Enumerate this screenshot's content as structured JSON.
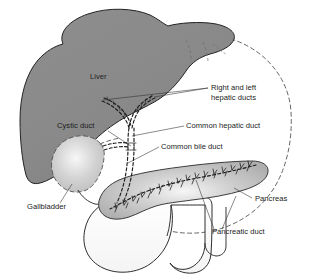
{
  "figure": {
    "background_color": "#ffffff",
    "width": 313,
    "height": 276
  },
  "colors": {
    "liver_fill": "#8a8a8a",
    "liver_stroke": "#232323",
    "pancreas_fill": "#b4b4b4",
    "pancreas_highlight": "#f2f2f2",
    "gallbladder_fill": "#c9c9c9",
    "gallbladder_highlight": "#f4f4f4",
    "duodenum_fill": "#ffffff",
    "duct_stroke": "#1c1c1c",
    "dashed_outline": "#4a4a4a",
    "label_text": "#1b1b1b",
    "leader_line": "#2b2b2b"
  },
  "labels": [
    {
      "id": "liver",
      "text": "Liver",
      "x": 90,
      "y": 79,
      "anchor": "start",
      "has_leader": false,
      "kind": "organ-inline"
    },
    {
      "id": "right-and-left-hepatic-ducts",
      "text": "Right and left",
      "text_line2": "hepatic ducts",
      "x": 211,
      "y": 90,
      "anchor": "start",
      "has_leader": true,
      "kind": "duct"
    },
    {
      "id": "cystic-duct",
      "text": "Cystic duct",
      "x": 57,
      "y": 128,
      "anchor": "start",
      "has_leader": true,
      "kind": "duct"
    },
    {
      "id": "common-hepatic-duct",
      "text": "Common hepatic duct",
      "x": 186,
      "y": 128,
      "anchor": "start",
      "has_leader": true,
      "kind": "duct"
    },
    {
      "id": "common-bile-duct",
      "text": "Common bile duct",
      "x": 161,
      "y": 149,
      "anchor": "start",
      "has_leader": true,
      "kind": "duct"
    },
    {
      "id": "gallbladder",
      "text": "Gallbladder",
      "x": 27,
      "y": 209,
      "anchor": "start",
      "has_leader": true,
      "kind": "organ"
    },
    {
      "id": "pancreas",
      "text": "Pancreas",
      "x": 255,
      "y": 201,
      "anchor": "start",
      "has_leader": true,
      "kind": "organ"
    },
    {
      "id": "pancreatic-duct",
      "text": "Pancreatic duct",
      "x": 212,
      "y": 234,
      "anchor": "start",
      "has_leader": true,
      "kind": "duct"
    }
  ],
  "structures": [
    {
      "id": "liver",
      "name": "Liver",
      "style": "solid-gray-fill"
    },
    {
      "id": "gallbladder",
      "name": "Gallbladder",
      "style": "light-fill-dashed-outline"
    },
    {
      "id": "pancreas",
      "name": "Pancreas",
      "style": "gray-fill-gradient"
    },
    {
      "id": "duodenum",
      "name": "Duodenum",
      "style": "white-fill-outline"
    },
    {
      "id": "biliary-tree",
      "name": "Biliary duct tree",
      "style": "dashed-duct"
    },
    {
      "id": "abdominal-dashed-arc",
      "name": "Hidden contour arc",
      "style": "dashed"
    }
  ]
}
